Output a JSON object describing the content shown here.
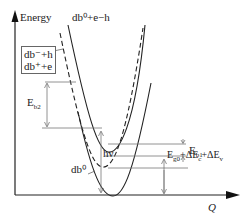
{
  "diagram": {
    "y_axis_label": "Energy",
    "x_axis_label": "Q",
    "curves": {
      "upper_solid": "db⁰+e−h",
      "dashed": [
        "db⁻+h",
        "db⁺+e"
      ],
      "lower": "db⁰"
    },
    "annotations": {
      "eb1": {
        "main": "E",
        "sub": "b1"
      },
      "eb2": {
        "main": "E",
        "sub": "b2"
      },
      "photon": "hν",
      "gap": {
        "text": "E",
        "sub1": "g0",
        "mid": "+ΔE",
        "sub2": "c",
        "mid2": "+ΔE",
        "sub3": "v"
      }
    },
    "colors": {
      "line": "#222222",
      "guide": "#777777"
    }
  }
}
